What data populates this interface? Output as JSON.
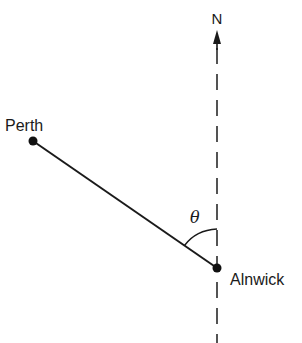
{
  "diagram": {
    "type": "bearing-diagram",
    "north_label": "N",
    "angle_label": "θ",
    "points": [
      {
        "name": "Perth",
        "label": "Perth"
      },
      {
        "name": "Alnwick",
        "label": "Alnwick"
      }
    ],
    "colors": {
      "ink": "#1a1a1a",
      "background": "#ffffff"
    }
  }
}
